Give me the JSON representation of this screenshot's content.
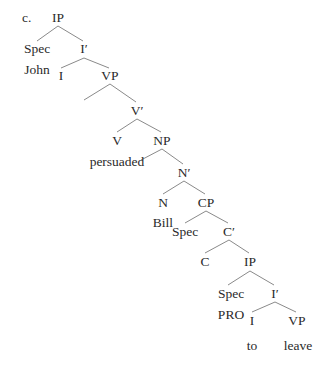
{
  "example_label": "c.",
  "tree": {
    "nodes": [
      {
        "id": "ip1",
        "label": "IP",
        "x": 58,
        "y": 18
      },
      {
        "id": "spec1",
        "label": "Spec",
        "x": 37,
        "y": 49
      },
      {
        "id": "john",
        "label": "John",
        "x": 37,
        "y": 70
      },
      {
        "id": "ibar1",
        "label": "I′",
        "x": 84,
        "y": 49
      },
      {
        "id": "i1",
        "label": "I",
        "x": 61,
        "y": 76
      },
      {
        "id": "vp1",
        "label": "VP",
        "x": 110,
        "y": 76
      },
      {
        "id": "vbar",
        "label": "V′",
        "x": 137,
        "y": 111
      },
      {
        "id": "v",
        "label": "V",
        "x": 117,
        "y": 141
      },
      {
        "id": "persuaded",
        "label": "persuaded",
        "x": 117,
        "y": 162
      },
      {
        "id": "np",
        "label": "NP",
        "x": 162,
        "y": 141
      },
      {
        "id": "nbar",
        "label": "N′",
        "x": 184,
        "y": 173
      },
      {
        "id": "n",
        "label": "N",
        "x": 163,
        "y": 203
      },
      {
        "id": "bill",
        "label": "Bill",
        "x": 163,
        "y": 223
      },
      {
        "id": "cp",
        "label": "CP",
        "x": 206,
        "y": 203
      },
      {
        "id": "spec2",
        "label": "Spec",
        "x": 185,
        "y": 232
      },
      {
        "id": "cbar",
        "label": "C′",
        "x": 229,
        "y": 232
      },
      {
        "id": "c",
        "label": "C",
        "x": 205,
        "y": 262
      },
      {
        "id": "ip2",
        "label": "IP",
        "x": 250,
        "y": 262
      },
      {
        "id": "spec3",
        "label": "Spec",
        "x": 231,
        "y": 294
      },
      {
        "id": "pro",
        "label": "PRO",
        "x": 231,
        "y": 315
      },
      {
        "id": "ibar2",
        "label": "I′",
        "x": 275,
        "y": 294
      },
      {
        "id": "i2",
        "label": "I",
        "x": 252,
        "y": 321
      },
      {
        "id": "to",
        "label": "to",
        "x": 252,
        "y": 346
      },
      {
        "id": "vp2",
        "label": "VP",
        "x": 297,
        "y": 321
      },
      {
        "id": "leave",
        "label": "leave",
        "x": 298,
        "y": 346
      }
    ],
    "edges": [
      {
        "from": [
          58,
          26
        ],
        "to": [
          37,
          41
        ]
      },
      {
        "from": [
          58,
          26
        ],
        "to": [
          83,
          41
        ]
      },
      {
        "from": [
          84,
          58
        ],
        "to": [
          61,
          68
        ]
      },
      {
        "from": [
          84,
          58
        ],
        "to": [
          109,
          68
        ]
      },
      {
        "from": [
          110,
          84
        ],
        "to": [
          84,
          100
        ]
      },
      {
        "from": [
          110,
          84
        ],
        "to": [
          136,
          102
        ]
      },
      {
        "from": [
          137,
          119
        ],
        "to": [
          117,
          132
        ]
      },
      {
        "from": [
          137,
          119
        ],
        "to": [
          161,
          132
        ]
      },
      {
        "from": [
          162,
          149
        ],
        "to": [
          141,
          160
        ]
      },
      {
        "from": [
          162,
          149
        ],
        "to": [
          183,
          164
        ]
      },
      {
        "from": [
          184,
          181
        ],
        "to": [
          163,
          194
        ]
      },
      {
        "from": [
          184,
          181
        ],
        "to": [
          205,
          194
        ]
      },
      {
        "from": [
          206,
          211
        ],
        "to": [
          185,
          223
        ]
      },
      {
        "from": [
          206,
          211
        ],
        "to": [
          228,
          223
        ]
      },
      {
        "from": [
          229,
          240
        ],
        "to": [
          205,
          253
        ]
      },
      {
        "from": [
          229,
          240
        ],
        "to": [
          249,
          253
        ]
      },
      {
        "from": [
          250,
          271
        ],
        "to": [
          228,
          285
        ]
      },
      {
        "from": [
          250,
          271
        ],
        "to": [
          274,
          285
        ]
      },
      {
        "from": [
          275,
          302
        ],
        "to": [
          252,
          312
        ]
      },
      {
        "from": [
          275,
          302
        ],
        "to": [
          296,
          312
        ]
      }
    ],
    "line_color": "#8a8a8a"
  }
}
